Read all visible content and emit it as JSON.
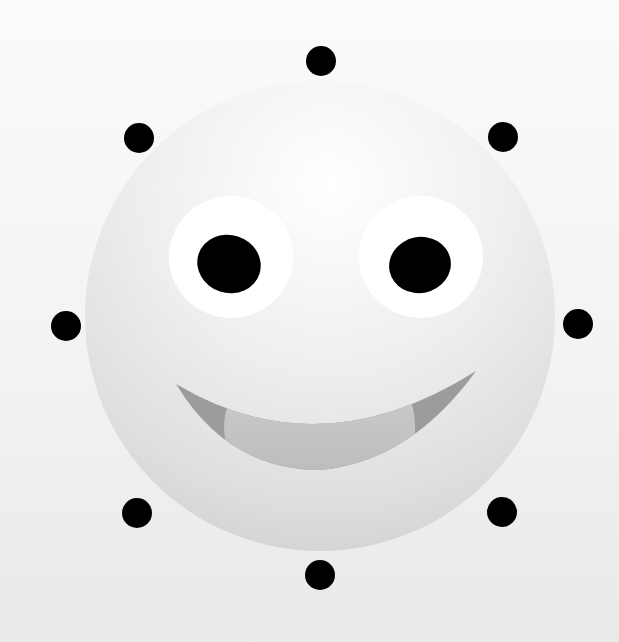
{
  "illustration": {
    "subject": "smiling sun face",
    "colors": {
      "background_top": "#fbfbfb",
      "background_bottom": "#e9e9e9",
      "sphere_highlight": "#ffffff",
      "sphere_mid": "#ececec",
      "sphere_shadow": "#c9c9c9",
      "eye_white": "#ffffff",
      "pupil": "#000000",
      "mouth_dark": "#9a9a9a",
      "mouth_light": "#c3c3c3",
      "ray_dot": "#000000"
    },
    "sphere": {
      "cx": 320,
      "cy": 316,
      "r": 235
    },
    "ray_dots": [
      {
        "name": "top",
        "cx": 321,
        "cy": 61,
        "r": 15
      },
      {
        "name": "top-right",
        "cx": 503,
        "cy": 137,
        "r": 15
      },
      {
        "name": "right",
        "cx": 578,
        "cy": 324,
        "r": 15
      },
      {
        "name": "bottom-right",
        "cx": 502,
        "cy": 512,
        "r": 15
      },
      {
        "name": "bottom",
        "cx": 320,
        "cy": 575,
        "r": 15
      },
      {
        "name": "bottom-left",
        "cx": 137,
        "cy": 513,
        "r": 15
      },
      {
        "name": "left",
        "cx": 66,
        "cy": 326,
        "r": 15
      },
      {
        "name": "top-left",
        "cx": 139,
        "cy": 138,
        "r": 15
      }
    ],
    "eyes": [
      {
        "name": "left",
        "white": {
          "cx": 231,
          "cy": 255,
          "rx": 62,
          "ry": 62
        },
        "pupil": {
          "cx": 228,
          "cy": 264,
          "rx": 32,
          "ry": 29
        }
      },
      {
        "name": "right",
        "white": {
          "cx": 420,
          "cy": 255,
          "rx": 62,
          "ry": 62
        },
        "pupil": {
          "cx": 420,
          "cy": 265,
          "rx": 31,
          "ry": 28
        }
      }
    ]
  }
}
